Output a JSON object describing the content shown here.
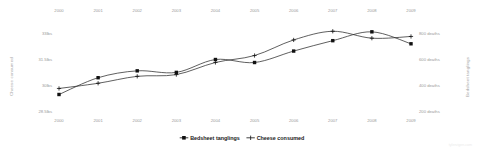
{
  "chart_data": {
    "type": "line",
    "title": "",
    "subtitle": "",
    "x": [
      2000,
      2001,
      2002,
      2003,
      2004,
      2005,
      2006,
      2007,
      2008,
      2009
    ],
    "x_tick_labels": [
      "2000",
      "2001",
      "2002",
      "2003",
      "2004",
      "2005",
      "2006",
      "2007",
      "2008",
      "2009"
    ],
    "xlabel": "",
    "grid": false,
    "legend_position": "bottom-center",
    "axes": {
      "top_x": {
        "labels": [
          "2000",
          "2001",
          "2002",
          "2003",
          "2004",
          "2005",
          "2006",
          "2007",
          "2008",
          "2009"
        ]
      },
      "bottom_x": {
        "labels": [
          "2000",
          "2001",
          "2002",
          "2003",
          "2004",
          "2005",
          "2006",
          "2007",
          "2008",
          "2009"
        ]
      },
      "left_y": {
        "title": "Cheese consumed",
        "tick_labels": [
          "33lbs",
          "31.5lbs",
          "30lbs",
          "28.5lbs"
        ],
        "tick_values": [
          33,
          31.5,
          30,
          28.5
        ],
        "ylim": [
          28.5,
          33.0
        ]
      },
      "right_y": {
        "title": "Bedsheet tanglings",
        "tick_labels": [
          "800 deaths",
          "600 deaths",
          "400 deaths",
          "200 deaths"
        ],
        "tick_values": [
          800,
          600,
          400,
          200
        ],
        "ylim": [
          200,
          800
        ]
      }
    },
    "series": [
      {
        "name": "Bedsheet tanglings",
        "axis": "right",
        "marker": "square",
        "unit": "deaths",
        "values": [
          327,
          456,
          509,
          497,
          596,
          573,
          661,
          741,
          809,
          717
        ]
      },
      {
        "name": "Cheese consumed",
        "axis": "left",
        "marker": "plus",
        "unit": "lbs",
        "values": [
          29.8,
          30.1,
          30.5,
          30.6,
          31.3,
          31.7,
          32.6,
          33.1,
          32.7,
          32.8
        ]
      }
    ]
  },
  "legend": {
    "items": [
      {
        "label": "Bedsheet tanglings",
        "marker": "square"
      },
      {
        "label": "Cheese consumed",
        "marker": "plus"
      }
    ]
  },
  "watermark": {
    "text": "tylervigen.com"
  },
  "colors": {
    "line": "#2b2b2b",
    "marker": "#111111",
    "tick_text": "#9a9a9a",
    "axis_title": "#a8a8a8",
    "legend_text": "#1a1a1a",
    "background": "#ffffff",
    "watermark": "#ebebeb"
  }
}
